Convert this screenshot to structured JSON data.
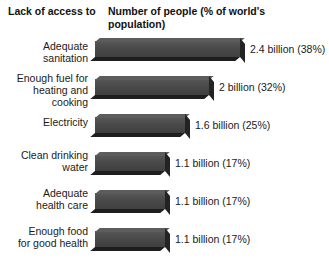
{
  "header": {
    "left_title": "Lack of\naccess to",
    "right_title": "Number of people\n(% of world's population)"
  },
  "chart_data": {
    "type": "bar",
    "orientation": "horizontal",
    "title": "Lack of access to",
    "xlabel": "Number of people (% of world's population)",
    "ylabel": "Lack of access to",
    "grid": false,
    "legend": "none",
    "units": "billions of people",
    "categories": [
      "Adequate sanitation",
      "Enough fuel for heating and cooking",
      "Electricity",
      "Clean drinking water",
      "Adequate health care",
      "Enough food for good health"
    ],
    "values": [
      2.4,
      2.0,
      1.6,
      1.1,
      1.1,
      1.1
    ],
    "percents": [
      38,
      32,
      25,
      17,
      17,
      17
    ],
    "xlim": [
      0,
      2.4
    ],
    "bar_color": "#4a4a4a",
    "rows": [
      {
        "label": "Adequate\nsanitation",
        "value": 2.4,
        "percent": 38,
        "value_text": "2.4 billion (38%)",
        "bar_width": 145
      },
      {
        "label": "Enough fuel for\nheating and\ncooking",
        "value": 2.0,
        "percent": 32,
        "value_text": "2 billion (32%)",
        "bar_width": 114
      },
      {
        "label": "Electricity",
        "value": 1.6,
        "percent": 25,
        "value_text": "1.6 billion (25%)",
        "bar_width": 90
      },
      {
        "label": "Clean drinking\nwater",
        "value": 1.1,
        "percent": 17,
        "value_text": "1.1 billion (17%)",
        "bar_width": 70
      },
      {
        "label": "Adequate\nhealth care",
        "value": 1.1,
        "percent": 17,
        "value_text": "1.1 billion (17%)",
        "bar_width": 70
      },
      {
        "label": "Enough food\nfor good health",
        "value": 1.1,
        "percent": 17,
        "value_text": "1.1 billion (17%)",
        "bar_width": 70
      }
    ]
  }
}
